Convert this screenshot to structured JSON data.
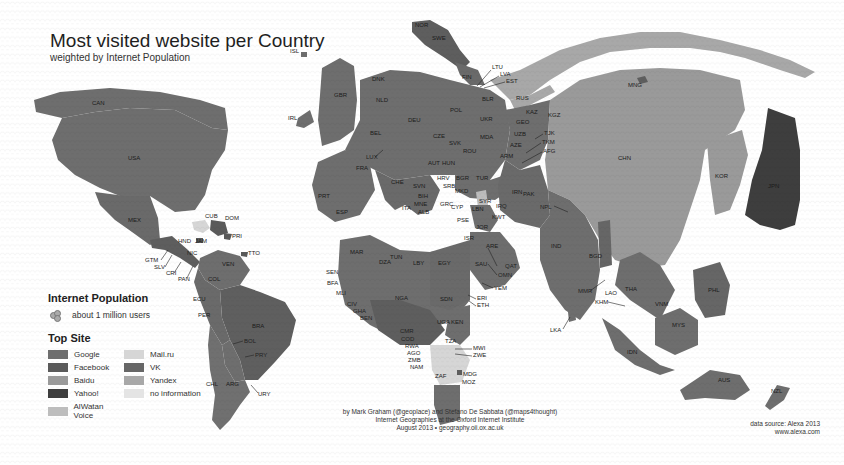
{
  "header": {
    "title": "Most visited website per Country",
    "subtitle": "weighted by Internet Population"
  },
  "legend": {
    "population_title": "Internet Population",
    "population_unit": "about 1 million users",
    "site_title": "Top Site",
    "items": [
      {
        "label": "Google",
        "color": "#6e6e6e"
      },
      {
        "label": "Mail.ru",
        "color": "#d6d6d6"
      },
      {
        "label": "Facebook",
        "color": "#5a5a5a"
      },
      {
        "label": "VK",
        "color": "#666666"
      },
      {
        "label": "Baidu",
        "color": "#9a9a9a"
      },
      {
        "label": "Yandex",
        "color": "#a8a8a8"
      },
      {
        "label": "Yahoo!",
        "color": "#3e3e3e"
      },
      {
        "label": "no information",
        "color": "#e4e4e4"
      },
      {
        "label": "AlWatan Voice",
        "color": "#bdbdbd"
      }
    ]
  },
  "credits": {
    "line1": "by Mark Graham (@geoplace) and Stefano De Sabbata (@maps4thought)",
    "line2": "Internet Geographies at the Oxford Internet Institute",
    "line3": "August 2013 • geography.oii.ox.ac.uk"
  },
  "source": {
    "line1": "data source: Alexa 2013",
    "line2": "www.alexa.com"
  },
  "map": {
    "labels": {
      "CAN": "CAN",
      "USA": "USA",
      "MEX": "MEX",
      "CUB": "CUB",
      "DOM": "DOM",
      "PRI": "PRI",
      "HND": "HND",
      "JAM": "JAM",
      "NIC": "NIC",
      "GTM": "GTM",
      "SLV": "SLV",
      "CRI": "CRI",
      "PAN": "PAN",
      "TTO": "TTO",
      "VEN": "VEN",
      "COL": "COL",
      "ECU": "ECU",
      "PER": "PER",
      "BRA": "BRA",
      "BOL": "BOL",
      "PRY": "PRY",
      "CHL": "CHL",
      "ARG": "ARG",
      "URY": "URY",
      "ISL": "ISL",
      "IRL": "IRL",
      "GBR": "GBR",
      "NOR": "NOR",
      "SWE": "SWE",
      "DNK": "DNK",
      "FIN": "FIN",
      "LTU": "LTU",
      "LVA": "LVA",
      "EST": "EST",
      "NLD": "NLD",
      "DEU": "DEU",
      "POL": "POL",
      "BLR": "BLR",
      "RUS": "RUS",
      "KAZ": "KAZ",
      "KGZ": "KGZ",
      "MNG": "MNG",
      "BEL": "BEL",
      "LUX": "LUX",
      "CZE": "CZE",
      "SVK": "SVK",
      "UKR": "UKR",
      "MDA": "MDA",
      "GEO": "GEO",
      "UZB": "UZB",
      "TJK": "TJK",
      "TKM": "TKM",
      "AFG": "AFG",
      "AZE": "AZE",
      "ARM": "ARM",
      "ROU": "ROU",
      "FRA": "FRA",
      "AUT": "AUT",
      "HUN": "HUN",
      "CHE": "CHE",
      "SVN": "SVN",
      "HRV": "HRV",
      "BGR": "BGR",
      "TUR": "TUR",
      "SRB": "SRB",
      "BIH": "BIH",
      "MKD": "MKD",
      "MNE": "MNE",
      "ALB": "ALB",
      "GRC": "GRC",
      "ITA": "ITA",
      "PRT": "PRT",
      "ESP": "ESP",
      "IRN": "IRN",
      "PAK": "PAK",
      "SYR": "SYR",
      "LBN": "LBN",
      "IRQ": "IRQ",
      "CYP": "CYP",
      "PSE": "PSE",
      "ISR": "ISR",
      "JOR": "JOR",
      "KWT": "KWT",
      "NPL": "NPL",
      "CHN": "CHN",
      "KOR": "KOR",
      "JPN": "JPN",
      "IND": "IND",
      "BGD": "BGD",
      "MMR": "MMR",
      "LAO": "LAO",
      "THA": "THA",
      "KHM": "KHM",
      "VNM": "VNM",
      "PHL": "PHL",
      "LKA": "LKA",
      "MYS": "MYS",
      "IDN": "IDN",
      "AUS": "AUS",
      "NZL": "NZL",
      "MAR": "MAR",
      "DZA": "DZA",
      "TUN": "TUN",
      "LBY": "LBY",
      "EGY": "EGY",
      "SAU": "SAU",
      "ARE": "ARE",
      "QAT": "QAT",
      "OMN": "OMN",
      "YEM": "YEM",
      "SEN": "SEN",
      "BFA": "BFA",
      "MLI": "MLI",
      "CIV": "CIV",
      "GHA": "GHA",
      "BEN": "BEN",
      "NGA": "NGA",
      "SDN": "SDN",
      "ERI": "ERI",
      "ETH": "ETH",
      "UGA": "UGA",
      "KEN": "KEN",
      "CMR": "CMR",
      "COD": "COD",
      "RWA": "RWA",
      "AGO": "AGO",
      "ZMB": "ZMB",
      "NAM": "NAM",
      "TZA": "TZA",
      "MWI": "MWI",
      "ZWE": "ZWE",
      "ZAF": "ZAF",
      "MDG": "MDG",
      "MOZ": "MOZ"
    },
    "colors": {
      "google": "#6e6e6e",
      "facebook": "#5a5a5a",
      "baidu": "#9a9a9a",
      "yahoo": "#3e3e3e",
      "alwatan": "#bdbdbd",
      "mailru": "#d6d6d6",
      "vk": "#666666",
      "yandex": "#a8a8a8",
      "noinfo": "#e4e4e4"
    }
  }
}
